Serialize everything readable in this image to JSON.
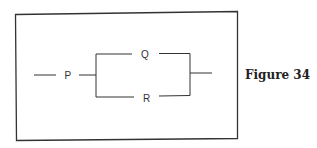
{
  "figure": {
    "caption": "Figure 34",
    "type": "circuit-diagram"
  },
  "diagram": {
    "frame_color": "#333333",
    "line_color": "#333333",
    "nodes": [
      {
        "id": "P",
        "label": "P",
        "position": "series-input"
      },
      {
        "id": "Q",
        "label": "Q",
        "position": "parallel-upper"
      },
      {
        "id": "R",
        "label": "R",
        "position": "parallel-lower"
      }
    ],
    "connections": [
      {
        "from": "input",
        "to": "P"
      },
      {
        "from": "P",
        "to": "Q"
      },
      {
        "from": "P",
        "to": "R"
      },
      {
        "from": "Q",
        "to": "output"
      },
      {
        "from": "R",
        "to": "output"
      }
    ],
    "labels": {
      "p": "P",
      "q": "Q",
      "r": "R"
    }
  }
}
